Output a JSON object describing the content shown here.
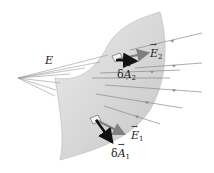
{
  "figure": {
    "labels": {
      "field": "E",
      "e2_main": "E",
      "e2_sub": "2",
      "da2_prefix": "δ",
      "da2_main": "A",
      "da2_sub": "2",
      "e1_main": "E",
      "e1_sub": "1",
      "da1_prefix": "δ",
      "da1_main": "A",
      "da1_sub": "1"
    },
    "colors": {
      "surface": "#dcdcdc",
      "field_lines": "#8a8a8a",
      "area_vector": "#111111",
      "e_vector": "#7a7a7a"
    }
  }
}
